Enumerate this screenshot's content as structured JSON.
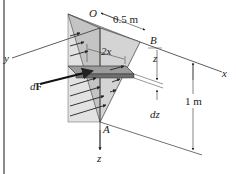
{
  "figure": {
    "labels": {
      "origin": "O",
      "width_dim": "0.5 m",
      "point_B": "B",
      "point_A": "A",
      "axis_x": "x",
      "axis_y": "y",
      "axis_z_mid": "z",
      "axis_z_bottom": "z",
      "strip_width": "2x",
      "strip_thickness": "dz",
      "depth_dim": "1 m",
      "force_d": "d",
      "force_F": "F"
    },
    "colors": {
      "plate_fill": "#bdbdbd",
      "plate_front": "#d6d6d6",
      "pressure_fill": "#e4e4e4",
      "strip_fill": "#9a9a9a",
      "line": "#333333",
      "border": "#8a8a8a"
    }
  }
}
